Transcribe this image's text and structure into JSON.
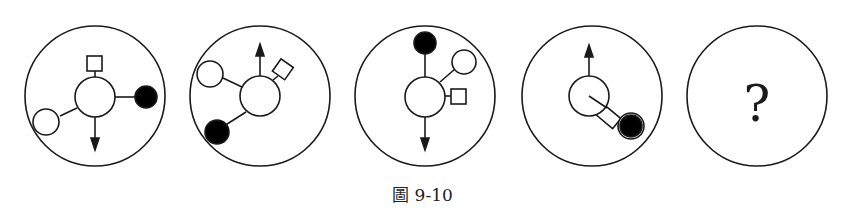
{
  "figure": {
    "caption": "圖 9-10",
    "question_mark": "?",
    "stroke_color": "#1a1a1a",
    "fill_black": "#000000",
    "fill_white": "#ffffff",
    "panels": [
      {
        "id": 1,
        "elements": [
          "center-circle",
          "square-top",
          "black-dot-right",
          "white-circle-lower-left",
          "arrow-down"
        ]
      },
      {
        "id": 2,
        "elements": [
          "center-circle",
          "arrow-up",
          "square-upper-right",
          "white-circle-upper-left",
          "black-dot-lower-left"
        ]
      },
      {
        "id": 3,
        "elements": [
          "center-circle",
          "black-dot-top",
          "white-circle-upper-right",
          "square-right",
          "arrow-down"
        ]
      },
      {
        "id": 4,
        "elements": [
          "center-circle",
          "arrow-up",
          "square-lower-right",
          "black-dot-in-white-circle-lower-right",
          "inner-line"
        ]
      },
      {
        "id": 5,
        "elements": [
          "question-mark"
        ]
      }
    ]
  }
}
